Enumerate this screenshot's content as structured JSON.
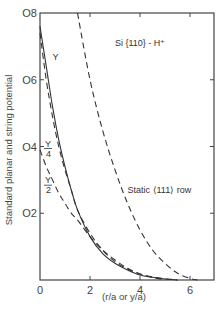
{
  "chart_data": {
    "type": "line",
    "title": "",
    "xlabel": "(r/a or y/a)",
    "ylabel": "Standard planar and string potential",
    "xlim": [
      0,
      7
    ],
    "ylim": [
      0,
      0.8
    ],
    "x_ticks": [
      "0",
      "2",
      "4",
      "6"
    ],
    "y_ticks": [
      "0",
      "0.2",
      "0.4",
      "0.6",
      "0.8"
    ],
    "y_tick_labels_display": [
      "0",
      "O2",
      "O4",
      "O6",
      "O8"
    ],
    "grid": false,
    "legend": null,
    "annotations": [
      {
        "text": "Si {110} - H⁺",
        "x": 3.0,
        "y": 0.7
      },
      {
        "text": "Static ⟨111⟩ row",
        "x": 3.5,
        "y": 0.26
      },
      {
        "text": "Y",
        "x": 0.5,
        "y": 0.66
      },
      {
        "text": "Y/4",
        "x": 0.2,
        "y": 0.4
      },
      {
        "text": "Y/2",
        "x": 0.2,
        "y": 0.29
      }
    ],
    "series": [
      {
        "name": "Y (planar, solid)",
        "style": "solid",
        "x": [
          0,
          0.25,
          0.5,
          0.75,
          1.0,
          1.25,
          1.5,
          2.0,
          2.5,
          3.0,
          3.5,
          4.0,
          4.5,
          5.0,
          5.5
        ],
        "y": [
          0.76,
          0.64,
          0.52,
          0.42,
          0.34,
          0.27,
          0.21,
          0.13,
          0.08,
          0.05,
          0.03,
          0.015,
          0.008,
          0.003,
          0.0
        ]
      },
      {
        "name": "Y/4 (dashed)",
        "style": "dashed",
        "x": [
          0,
          0.25,
          0.5,
          0.75,
          1.0,
          1.25,
          1.5,
          2.0,
          2.5,
          3.0,
          3.5,
          4.0,
          4.5,
          5.0,
          5.5
        ],
        "y": [
          0.74,
          0.6,
          0.49,
          0.4,
          0.33,
          0.27,
          0.21,
          0.14,
          0.09,
          0.055,
          0.033,
          0.018,
          0.009,
          0.004,
          0.0
        ]
      },
      {
        "name": "Y/2 (dashed)",
        "style": "dashed",
        "x": [
          0,
          0.25,
          0.5,
          0.75,
          1.0,
          1.25,
          1.5,
          2.0,
          2.5,
          3.0,
          3.5,
          4.0,
          4.5,
          5.0
        ],
        "y": [
          0.39,
          0.34,
          0.3,
          0.26,
          0.23,
          0.2,
          0.18,
          0.13,
          0.09,
          0.06,
          0.035,
          0.018,
          0.008,
          0.0
        ]
      },
      {
        "name": "Static <111> row (string, dashed)",
        "style": "dashed",
        "x": [
          1.5,
          2.0,
          2.5,
          3.0,
          3.5,
          4.0,
          4.5,
          5.0,
          5.5,
          6.0,
          6.3
        ],
        "y": [
          0.8,
          0.6,
          0.45,
          0.33,
          0.23,
          0.15,
          0.09,
          0.05,
          0.02,
          0.005,
          0.0
        ]
      }
    ]
  },
  "plot_area_px": {
    "left": 40,
    "top": 13,
    "right": 214,
    "bottom": 280
  },
  "x_px_per_unit": 25,
  "y_px_per_unit": 333.75
}
